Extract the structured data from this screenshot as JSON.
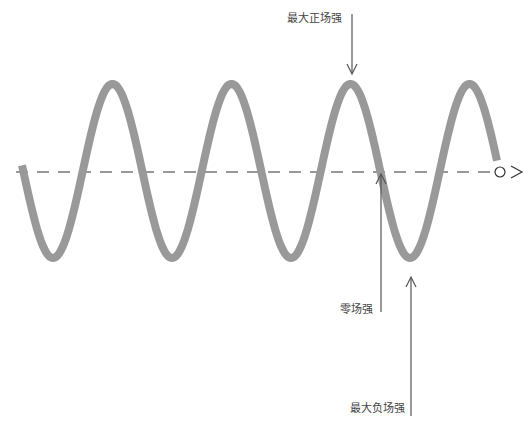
{
  "diagram": {
    "title": "",
    "colors": {
      "wave": "#999999",
      "axis": "#333333",
      "arrow": "#555555",
      "text": "#444444"
    },
    "wave": {
      "axis_y": 171,
      "amplitude": 87,
      "period": 119,
      "start_x": 22,
      "end_x": 497,
      "first_trough_x": 53
    },
    "labels": {
      "max_positive": "最大正场强",
      "zero": "零场强",
      "max_negative": "最大负场强"
    },
    "icons": {
      "axis_end_circle": "circle-icon",
      "axis_end_arrow": "arrow-right-icon"
    }
  }
}
